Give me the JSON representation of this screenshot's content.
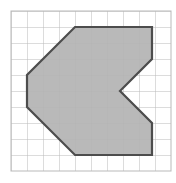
{
  "figure": {
    "type": "geometry-grid-figure",
    "background_color": "#ffffff",
    "canvas": {
      "width": 176,
      "height": 183
    }
  },
  "grid": {
    "name": "square-grid",
    "origin_x": 11,
    "origin_y": 11,
    "cell_size": 16,
    "columns": 10,
    "rows": 10,
    "line_color": "#b9b9b9",
    "line_width": 1,
    "visible": true,
    "label": "grid"
  },
  "shape": {
    "name": "arrow-polygon",
    "label": "Shaded polygon",
    "fill_color": "#b3b3b3",
    "stroke_color": "#4d4d4d",
    "stroke_width": 2.2,
    "vertex_count": 9,
    "vertices_px": [
      [
        75,
        27
      ],
      [
        152,
        27
      ],
      [
        152,
        59
      ],
      [
        120,
        91
      ],
      [
        152,
        123
      ],
      [
        152,
        155
      ],
      [
        75,
        155
      ],
      [
        27,
        107
      ],
      [
        27,
        75
      ]
    ],
    "vertices_grid": [
      [
        4,
        1
      ],
      [
        8.8,
        1
      ],
      [
        8.8,
        3
      ],
      [
        6.8,
        5
      ],
      [
        8.8,
        7
      ],
      [
        8.8,
        9
      ],
      [
        4,
        9
      ],
      [
        1,
        6
      ],
      [
        1,
        4
      ]
    ],
    "points_attribute": "75,27 152,27 152,59 120,91 152,123 152,155 75,155 27,107 27,75"
  }
}
